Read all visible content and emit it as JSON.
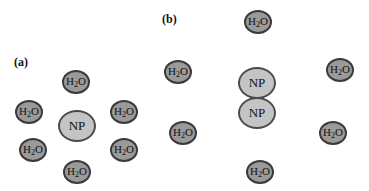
{
  "panels": [
    {
      "label": "(a)",
      "label_pos": [
        14,
        55
      ],
      "nanoparticles": [
        {
          "text": "NP",
          "center": [
            77,
            126
          ]
        }
      ],
      "water": [
        {
          "center": [
            76,
            82
          ]
        },
        {
          "center": [
            29,
            112
          ]
        },
        {
          "center": [
            124,
            112
          ]
        },
        {
          "center": [
            33,
            150
          ]
        },
        {
          "center": [
            124,
            150
          ]
        },
        {
          "center": [
            77,
            172
          ]
        }
      ]
    },
    {
      "label": "(b)",
      "label_pos": [
        162,
        12
      ],
      "nanoparticles": [
        {
          "text": "NP",
          "center": [
            257,
            83
          ]
        },
        {
          "text": "NP",
          "center": [
            257,
            113
          ]
        }
      ],
      "water": [
        {
          "center": [
            258,
            22
          ]
        },
        {
          "center": [
            178,
            72
          ]
        },
        {
          "center": [
            340,
            70
          ]
        },
        {
          "center": [
            183,
            133
          ]
        },
        {
          "center": [
            333,
            133
          ]
        },
        {
          "center": [
            260,
            172
          ]
        }
      ]
    }
  ],
  "water_text": {
    "main": "H",
    "sub": "2",
    "tail": "O"
  },
  "colors": {
    "water_fill": "#9a9a9a",
    "np_fill": "#c4c4c4",
    "outline": "#3a3a3a"
  }
}
